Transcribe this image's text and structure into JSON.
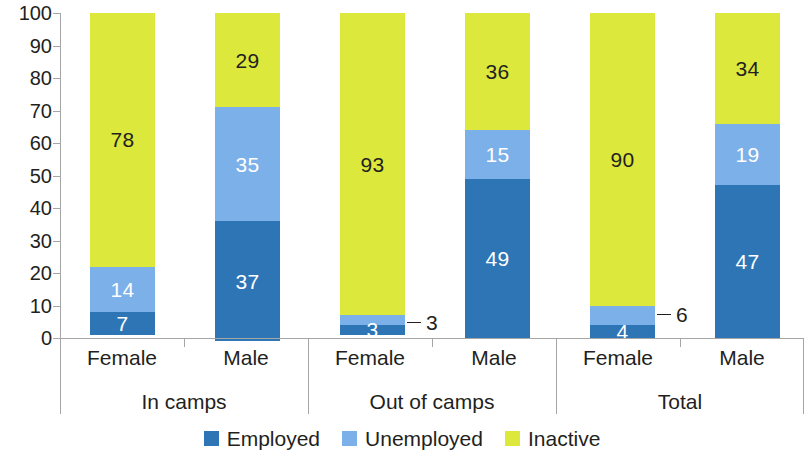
{
  "chart_data": {
    "type": "bar",
    "stacked": true,
    "stack_total": 100,
    "title": "",
    "subtitle": "",
    "xlabel": "",
    "ylabel": "",
    "ylim": [
      0,
      100
    ],
    "ytick_step": 10,
    "grid": false,
    "legend_position": "bottom",
    "categories": [
      "Female",
      "Male",
      "Female",
      "Male",
      "Female",
      "Male"
    ],
    "groups": [
      {
        "label": "In camps",
        "categories": [
          "Female",
          "Male"
        ]
      },
      {
        "label": "Out of camps",
        "categories": [
          "Female",
          "Male"
        ]
      },
      {
        "label": "Total",
        "categories": [
          "Female",
          "Male"
        ]
      }
    ],
    "series": [
      {
        "name": "Employed",
        "color": "#2E75B6",
        "values": [
          7,
          37,
          3,
          49,
          4,
          47
        ]
      },
      {
        "name": "Unemployed",
        "color": "#7BB0E8",
        "values": [
          14,
          35,
          3,
          15,
          6,
          19
        ]
      },
      {
        "name": "Inactive",
        "color": "#DCE83C",
        "values": [
          78,
          29,
          93,
          36,
          90,
          34
        ]
      }
    ],
    "ytick_labels": [
      "100",
      "90",
      "80",
      "70",
      "60",
      "50",
      "40",
      "30",
      "20",
      "10",
      "0"
    ],
    "ytick_values": [
      100,
      90,
      80,
      70,
      60,
      50,
      40,
      30,
      20,
      10,
      0
    ],
    "bars": [
      {
        "group": "In camps",
        "category": "Female",
        "segments": [
          {
            "series": "Inactive",
            "value": 78,
            "label": "78",
            "label_placement": "inside"
          },
          {
            "series": "Unemployed",
            "value": 14,
            "label": "14",
            "label_placement": "inside"
          },
          {
            "series": "Employed",
            "value": 7,
            "label": "7",
            "label_placement": "inside"
          }
        ]
      },
      {
        "group": "In camps",
        "category": "Male",
        "segments": [
          {
            "series": "Inactive",
            "value": 29,
            "label": "29",
            "label_placement": "inside"
          },
          {
            "series": "Unemployed",
            "value": 35,
            "label": "35",
            "label_placement": "inside"
          },
          {
            "series": "Employed",
            "value": 37,
            "label": "37",
            "label_placement": "inside"
          }
        ]
      },
      {
        "group": "Out of camps",
        "category": "Female",
        "segments": [
          {
            "series": "Inactive",
            "value": 93,
            "label": "93",
            "label_placement": "inside"
          },
          {
            "series": "Unemployed",
            "value": 3,
            "label": "3",
            "label_placement": "callout"
          },
          {
            "series": "Employed",
            "value": 3,
            "label": "3",
            "label_placement": "inside"
          }
        ]
      },
      {
        "group": "Out of camps",
        "category": "Male",
        "segments": [
          {
            "series": "Inactive",
            "value": 36,
            "label": "36",
            "label_placement": "inside"
          },
          {
            "series": "Unemployed",
            "value": 15,
            "label": "15",
            "label_placement": "inside"
          },
          {
            "series": "Employed",
            "value": 49,
            "label": "49",
            "label_placement": "inside"
          }
        ]
      },
      {
        "group": "Total",
        "category": "Female",
        "segments": [
          {
            "series": "Inactive",
            "value": 90,
            "label": "90",
            "label_placement": "inside"
          },
          {
            "series": "Unemployed",
            "value": 6,
            "label": "6",
            "label_placement": "callout"
          },
          {
            "series": "Employed",
            "value": 4,
            "label": "4",
            "label_placement": "inside"
          }
        ]
      },
      {
        "group": "Total",
        "category": "Male",
        "segments": [
          {
            "series": "Inactive",
            "value": 34,
            "label": "34",
            "label_placement": "inside"
          },
          {
            "series": "Unemployed",
            "value": 19,
            "label": "19",
            "label_placement": "inside"
          },
          {
            "series": "Employed",
            "value": 47,
            "label": "47",
            "label_placement": "inside"
          }
        ]
      }
    ]
  },
  "axis": {
    "y_labels": [
      "100",
      "90",
      "80",
      "70",
      "60",
      "50",
      "40",
      "30",
      "20",
      "10",
      "0"
    ],
    "category_labels": [
      "Female",
      "Male",
      "Female",
      "Male",
      "Female",
      "Male"
    ],
    "group_labels": [
      "In camps",
      "Out of camps",
      "Total"
    ]
  },
  "legend": {
    "items": [
      {
        "label": "Employed",
        "color": "#2E75B6"
      },
      {
        "label": "Unemployed",
        "color": "#7BB0E8"
      },
      {
        "label": "Inactive",
        "color": "#DCE83C"
      }
    ]
  },
  "callouts": [
    {
      "label": "3"
    },
    {
      "label": "6"
    }
  ]
}
